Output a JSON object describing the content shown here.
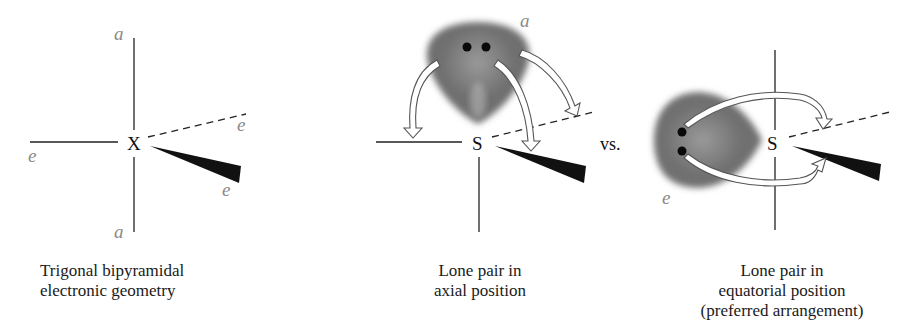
{
  "panels": [
    {
      "id": "tbp",
      "central_atom": "X",
      "labels": {
        "top": "a",
        "bottom": "a",
        "left": "e",
        "dashed": "e",
        "wedge": "e"
      },
      "caption": [
        "Trigonal bipyramidal",
        "electronic geometry"
      ]
    },
    {
      "id": "axial",
      "central_atom": "S",
      "lone_pair_label": "a",
      "caption": [
        "Lone pair in",
        "axial position"
      ]
    },
    {
      "id": "equatorial",
      "central_atom": "S",
      "lone_pair_label": "e",
      "caption": [
        "Lone pair in",
        "equatorial position",
        "(preferred arrangement)"
      ]
    }
  ],
  "separator": "vs.",
  "colors": {
    "bond": "#222222",
    "label": "#8a8a8a",
    "lobe_dark": "#5a5a5a",
    "lobe_light": "#a9a9a9"
  }
}
